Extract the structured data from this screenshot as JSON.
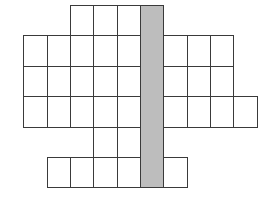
{
  "diagram": {
    "type": "grid-figure",
    "column_edges": [
      23,
      47,
      70,
      93,
      117,
      140,
      163,
      187,
      210,
      233,
      257
    ],
    "row_edges": [
      5,
      35,
      66,
      96,
      127,
      157,
      187
    ],
    "shaded_column": {
      "col": 5,
      "row_start": 0,
      "row_end": 5,
      "color": "#bdbdbd"
    },
    "line_color": "#3a3a3a",
    "cell_color": "#ffffff",
    "rows": [
      {
        "row": 0,
        "cols": [
          2,
          3,
          4
        ]
      },
      {
        "row": 1,
        "cols": [
          0,
          1,
          2,
          3,
          4,
          6,
          7,
          8
        ]
      },
      {
        "row": 2,
        "cols": [
          0,
          1,
          2,
          3,
          4,
          6,
          7,
          8
        ]
      },
      {
        "row": 3,
        "cols": [
          0,
          1,
          2,
          3,
          4,
          6,
          7,
          8,
          9
        ]
      },
      {
        "row": 4,
        "cols": [
          3,
          4
        ]
      },
      {
        "row": 5,
        "cols": [
          1,
          2,
          3,
          4,
          6
        ]
      }
    ]
  }
}
